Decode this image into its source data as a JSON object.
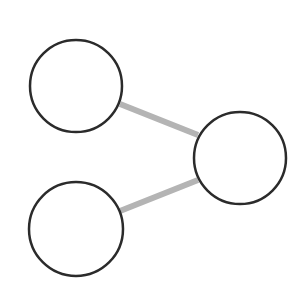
{
  "diagram": {
    "type": "graph",
    "background": "#ffffff",
    "node_style": {
      "fill": "#ffffff",
      "stroke": "#2b2b2b",
      "stroke_width": 2.5
    },
    "edge_style": {
      "stroke": "#b4b4b4",
      "stroke_width": 6
    },
    "nodes": [
      {
        "id": "node-top-left",
        "label": "",
        "cx": 76,
        "cy": 86,
        "r": 46
      },
      {
        "id": "node-right",
        "label": "",
        "cx": 240,
        "cy": 158,
        "r": 46
      },
      {
        "id": "node-bottom-left",
        "label": "",
        "cx": 76,
        "cy": 229,
        "r": 47
      }
    ],
    "edges": [
      {
        "id": "edge-top-left-right",
        "from": "node-top-left",
        "to": "node-right",
        "x1": 120,
        "y1": 104,
        "x2": 198,
        "y2": 135
      },
      {
        "id": "edge-bottom-left-right",
        "from": "node-bottom-left",
        "to": "node-right",
        "x1": 120,
        "y1": 211,
        "x2": 198,
        "y2": 180
      }
    ]
  }
}
